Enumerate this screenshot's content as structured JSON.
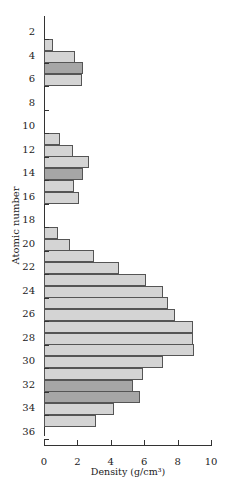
{
  "chart_data": {
    "type": "bar",
    "orientation": "horizontal",
    "title": "",
    "xlabel": "Density (g/cm³)",
    "ylabel": "Atomic number",
    "xlim": [
      0,
      10
    ],
    "ylim": [
      1,
      36
    ],
    "x_ticks": [
      0,
      2,
      4,
      6,
      8,
      10
    ],
    "y_ticks": [
      2,
      4,
      6,
      8,
      10,
      12,
      14,
      16,
      18,
      20,
      22,
      24,
      26,
      28,
      30,
      32,
      34,
      36
    ],
    "grid": false,
    "colors": {
      "normal": "#d4d4d4",
      "highlight": "#a6a6a6",
      "border": "#555555"
    },
    "categories": [
      3,
      4,
      5,
      6,
      11,
      12,
      13,
      14,
      15,
      16,
      19,
      20,
      21,
      22,
      23,
      24,
      25,
      26,
      27,
      28,
      29,
      30,
      31,
      32,
      33,
      34,
      35
    ],
    "values": [
      0.53,
      1.85,
      2.34,
      2.25,
      0.97,
      1.74,
      2.7,
      2.33,
      1.82,
      2.07,
      0.86,
      1.55,
      2.99,
      4.5,
      6.1,
      7.15,
      7.4,
      7.87,
      8.9,
      8.9,
      8.96,
      7.14,
      5.9,
      5.32,
      5.73,
      4.2,
      3.1
    ],
    "highlighted": [
      5,
      14,
      32,
      33
    ]
  }
}
